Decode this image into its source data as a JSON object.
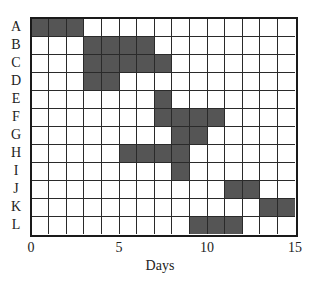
{
  "chart_data": {
    "type": "bar",
    "subtype": "gantt",
    "title": "",
    "xlabel": "Days",
    "ylabel": "",
    "xlim": [
      0,
      15
    ],
    "x_ticks": [
      0,
      5,
      10,
      15
    ],
    "x_tick_labels": [
      "0",
      "5",
      "10",
      "15"
    ],
    "grid": true,
    "grid_step": 1,
    "legend": null,
    "bar_color": "#555555",
    "categories": [
      "A",
      "B",
      "C",
      "D",
      "E",
      "F",
      "G",
      "H",
      "I",
      "J",
      "K",
      "L"
    ],
    "tasks": [
      {
        "name": "A",
        "start": 0,
        "end": 3
      },
      {
        "name": "B",
        "start": 3,
        "end": 7
      },
      {
        "name": "C",
        "start": 3,
        "end": 8
      },
      {
        "name": "D",
        "start": 3,
        "end": 5
      },
      {
        "name": "E",
        "start": 7,
        "end": 8
      },
      {
        "name": "F",
        "start": 7,
        "end": 11
      },
      {
        "name": "G",
        "start": 8,
        "end": 10
      },
      {
        "name": "H",
        "start": 5,
        "end": 9
      },
      {
        "name": "I",
        "start": 8,
        "end": 9
      },
      {
        "name": "J",
        "start": 11,
        "end": 13
      },
      {
        "name": "K",
        "start": 13,
        "end": 15
      },
      {
        "name": "L",
        "start": 9,
        "end": 12
      }
    ]
  }
}
